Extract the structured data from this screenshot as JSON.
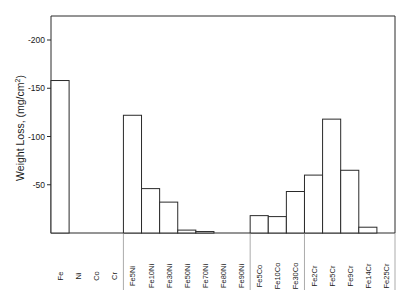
{
  "chart_data": {
    "type": "bar",
    "title": "",
    "xlabel": "",
    "ylabel": "Weight Loss, (mg/cm²)",
    "ylabel_main": "Weight Loss, (mg/cm",
    "ylabel_sup": "2",
    "ylabel_end": ")",
    "yticks": [
      "-50",
      "-100",
      "-150",
      "-200"
    ],
    "ytick_values": [
      -50,
      -100,
      -150,
      -200
    ],
    "ylim": [
      0,
      -225
    ],
    "grid": false,
    "legend": null,
    "categories": [
      "Fe",
      "Ni",
      "Co",
      "Cr",
      "Fe5Ni",
      "Fe10Ni",
      "Fe30Ni",
      "Fe50Ni",
      "Fe70Ni",
      "Fe80Ni",
      "Fe90Ni",
      "Fe5Co",
      "Fe10Co",
      "Fe30Co",
      "Fe2Cr",
      "Fe5Cr",
      "Fe9Cr",
      "Fe14Cr",
      "Fe25Cr"
    ],
    "values": [
      -158,
      0,
      0,
      0,
      -122,
      -46,
      -32,
      -3,
      -1.5,
      0,
      0,
      -18,
      -17,
      -43,
      -60,
      -118,
      -65,
      -6,
      0
    ],
    "groups": [
      {
        "name": "pure metals",
        "categories": [
          "Fe",
          "Ni",
          "Co",
          "Cr"
        ]
      },
      {
        "name": "Fe-Ni",
        "categories": [
          "Fe5Ni",
          "Fe10Ni",
          "Fe30Ni",
          "Fe50Ni",
          "Fe70Ni",
          "Fe80Ni",
          "Fe90Ni"
        ]
      },
      {
        "name": "Fe-Co",
        "categories": [
          "Fe5Co",
          "Fe10Co",
          "Fe30Co"
        ]
      },
      {
        "name": "Fe-Cr",
        "categories": [
          "Fe2Cr",
          "Fe5Cr",
          "Fe9Cr",
          "Fe14Cr",
          "Fe25Cr"
        ]
      }
    ]
  }
}
